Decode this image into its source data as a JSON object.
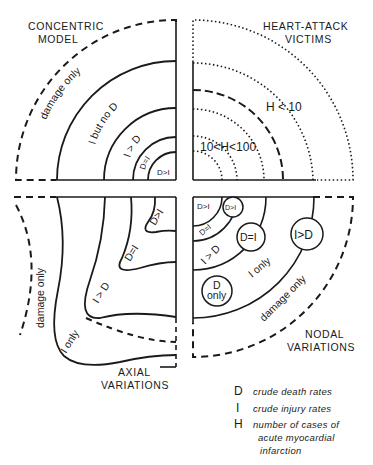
{
  "quadrants": {
    "top_left": {
      "title_line1": "CONCENTRIC",
      "title_line2": "MODEL",
      "regions": [
        "damage only",
        "I but no D",
        "I > D",
        "D=I",
        "D>I"
      ]
    },
    "top_right": {
      "title_line1": "HEART-ATTACK",
      "title_line2": "VICTIMS",
      "regions": [
        "H < 10",
        "10<H<100"
      ]
    },
    "bottom_left": {
      "title_line1": "AXIAL",
      "title_line2": "VARIATIONS",
      "regions": [
        "damage only",
        "I only",
        "I > D",
        "D=I",
        "D>I"
      ]
    },
    "bottom_right": {
      "title_line1": "NODAL",
      "title_line2": "VARIATIONS",
      "regions": [
        "D>I",
        "D>I",
        "D=I",
        "I > D",
        "D=I",
        "I>D",
        "I only",
        "D",
        "only",
        "damage only"
      ]
    }
  },
  "legend": [
    {
      "symbol": "D",
      "text_line1": "crude death rates"
    },
    {
      "symbol": "I",
      "text_line1": "crude injury rates"
    },
    {
      "symbol": "H",
      "text_line1": "number of cases of",
      "text_line2": "acute myocardial",
      "text_line3": "infarction"
    }
  ]
}
